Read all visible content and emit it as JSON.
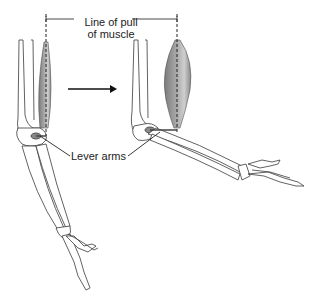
{
  "diagram": {
    "labels": {
      "line_of_pull_1": "Line of pull",
      "line_of_pull_2": "of muscle",
      "lever_arms": "Lever arms"
    },
    "colors": {
      "bone_outline": "#3a3a3a",
      "bone_fill": "#ffffff",
      "muscle_dark": "#7d7d7d",
      "muscle_light": "#c9c9c9",
      "lever_mark": "#4a4a4a",
      "text": "#222222"
    },
    "panels": [
      {
        "name": "arm-extended",
        "description": "Elbow extended, muscle elongated, short lever arm"
      },
      {
        "name": "arm-flexed",
        "description": "Elbow bent, muscle shortened and bulging, longer lever arm"
      }
    ],
    "arrow": {
      "direction": "right"
    }
  }
}
